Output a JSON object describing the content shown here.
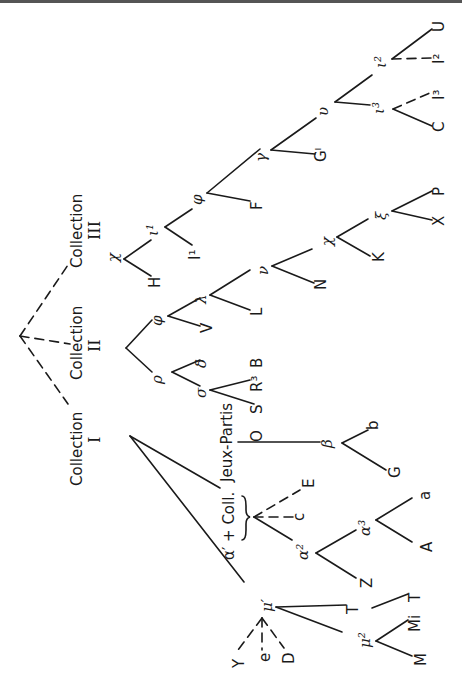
{
  "figure": {
    "orientation": "rotated 90° clockwise (text reads bottom-to-top)"
  },
  "collections": [
    {
      "id": "I",
      "label": "Collection",
      "numeral": "I"
    },
    {
      "id": "II",
      "label": "Collection",
      "numeral": "II"
    },
    {
      "id": "III",
      "label": "Collection",
      "numeral": "III"
    }
  ],
  "annotations": {
    "alpha_group": "α¹ + Coll. Jeux-Partis"
  },
  "nodes": {
    "collection_I": {
      "children": [
        "μ¹",
        "α¹ group",
        "β"
      ],
      "mu1": {
        "label": "μ¹",
        "solid_children": [
          "T",
          "μ²"
        ],
        "dashed_children": [
          "Y",
          "e",
          "D"
        ]
      },
      "T_sub": {
        "label": "T",
        "children": [
          "T"
        ]
      },
      "mu2": {
        "label": "μ²",
        "children": [
          "Mi",
          "M"
        ]
      },
      "alpha1": {
        "label": "α¹",
        "dashed_children": [
          "c",
          "E"
        ],
        "solid_children": [
          "α²"
        ]
      },
      "alpha2": {
        "label": "α²",
        "children": [
          "Z",
          "α³"
        ]
      },
      "alpha3": {
        "label": "α³",
        "children": [
          "A",
          "a"
        ]
      },
      "beta": {
        "label": "β",
        "children": [
          "G",
          "b"
        ]
      }
    },
    "collection_II": {
      "children": [
        "ρ",
        "φ"
      ],
      "rho": {
        "label": "ρ",
        "children": [
          "σ",
          "δ"
        ]
      },
      "sigma": {
        "label": "σ",
        "children": [
          "O",
          "S"
        ]
      },
      "delta": {
        "label": "δ",
        "children": [
          "R³",
          "B"
        ]
      },
      "phi": {
        "label": "φ",
        "children": [
          "V",
          "λ"
        ]
      },
      "lambda": {
        "label": "λ",
        "children": [
          "L",
          "ν"
        ]
      },
      "nu": {
        "label": "ν",
        "children": [
          "N",
          "χ"
        ]
      },
      "chi": {
        "label": "χ",
        "children": [
          "K",
          "ξ"
        ]
      },
      "xi": {
        "label": "ξ",
        "children": [
          "X",
          "P"
        ]
      }
    },
    "collection_III": {
      "children": [
        "χ"
      ],
      "chi": {
        "label": "χ",
        "children": [
          "H",
          "ι¹"
        ]
      },
      "iota1": {
        "label": "ι¹",
        "children": [
          "I¹",
          "φ"
        ]
      },
      "phi": {
        "label": "φ",
        "children": [
          "F",
          "γ"
        ]
      },
      "gamma": {
        "label": "γ",
        "children": [
          "G¹",
          "υ"
        ]
      },
      "upsilon": {
        "label": "υ",
        "children": [
          "ι³",
          "ι²"
        ]
      },
      "iota3": {
        "label": "ι³",
        "solid_children": [
          "C"
        ],
        "dashed_children": [
          "I³"
        ]
      },
      "iota2": {
        "label": "ι²",
        "solid_children": [
          "U"
        ],
        "dashed_children": [
          "I²"
        ]
      }
    }
  },
  "labels": {
    "coll_word": "Collection",
    "I": "I",
    "II": "II",
    "III": "III",
    "jeux_partis": "Jeux-Partis",
    "alpha_coll": "α′ + Coll.",
    "mu1": "μ′",
    "mu2": "μ²",
    "T1": "T",
    "T2": "T",
    "Mi": "Mi",
    "M": "M",
    "Y": "Y",
    "e": "e",
    "D": "D",
    "alpha2": "α²",
    "alpha3": "α³",
    "Z": "Z",
    "A": "A",
    "a": "a",
    "c": "c",
    "E": "E",
    "beta": "β",
    "G": "G",
    "b": "b",
    "rho": "ρ",
    "sigma": "σ",
    "delta": "δ",
    "O": "O",
    "S": "S",
    "R3": "R³",
    "B": "B",
    "phi2": "φ",
    "V": "V",
    "lambda": "λ",
    "L": "L",
    "nu": "ν",
    "N": "N",
    "chi2": "χ",
    "K": "K",
    "xi": "ξ",
    "X": "X",
    "P": "P",
    "chi3": "χ",
    "H": "H",
    "iota1": "ι¹",
    "I1": "I¹",
    "phi3": "φ",
    "F": "F",
    "gamma": "γ",
    "G1": "Gᴵ",
    "upsilon": "υ",
    "iota3": "ι³",
    "iota2": "ι²",
    "C": "C",
    "I3": "I³",
    "U": "U",
    "I2": "I²"
  }
}
